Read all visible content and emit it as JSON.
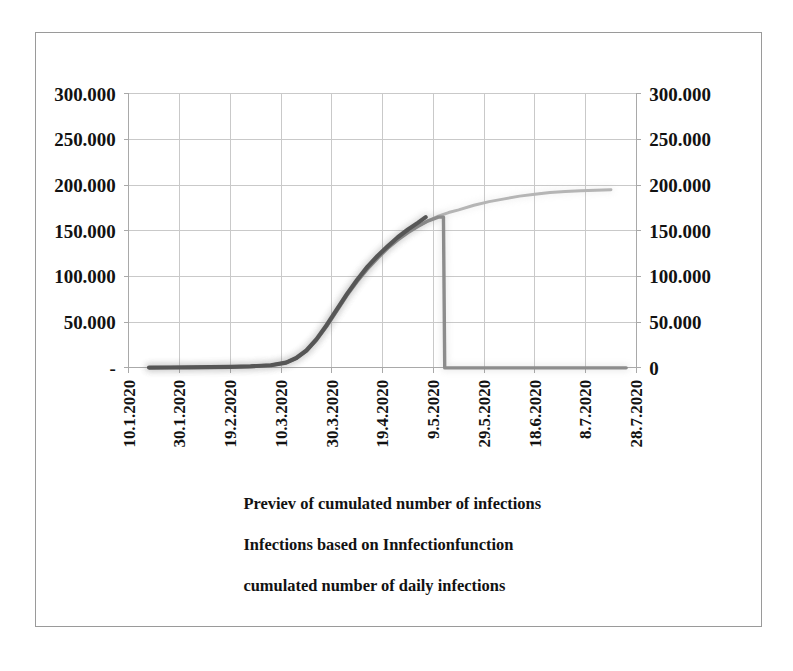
{
  "chart_data": {
    "type": "line",
    "title": "",
    "xlabel": "",
    "ylabel": "",
    "ylim": [
      0,
      300000
    ],
    "y_left_ticks": [
      "-",
      "50.000",
      "100.000",
      "150.000",
      "200.000",
      "250.000",
      "300.000"
    ],
    "y_right_ticks": [
      "0",
      "50.000",
      "100.000",
      "150.000",
      "200.000",
      "250.000",
      "300.000"
    ],
    "y_tick_values": [
      0,
      50000,
      100000,
      150000,
      200000,
      250000,
      300000
    ],
    "grid": true,
    "legend_position": "bottom",
    "x_tick_labels": [
      "10.1.2020",
      "30.1.2020",
      "19.2.2020",
      "10.3.2020",
      "30.3.2020",
      "19.4.2020",
      "9.5.2020",
      "29.5.2020",
      "18.6.2020",
      "8.7.2020",
      "28.7.2020"
    ],
    "x_tick_days": [
      0,
      20,
      40,
      60,
      80,
      100,
      120,
      140,
      160,
      180,
      200
    ],
    "xlim_days": [
      0,
      200
    ],
    "series": [
      {
        "name": "Previev of cumulated number of infections",
        "color": "#b5b5b5",
        "width": 3.0,
        "x": [
          8,
          16,
          24,
          32,
          40,
          48,
          56,
          62,
          66,
          70,
          74,
          78,
          82,
          86,
          90,
          94,
          98,
          102,
          106,
          110,
          114,
          118,
          122,
          126,
          130,
          136,
          142,
          148,
          154,
          160,
          166,
          172,
          178,
          184,
          190
        ],
        "values": [
          400,
          500,
          700,
          900,
          1200,
          1800,
          3000,
          6000,
          11000,
          19000,
          31000,
          46000,
          63000,
          80000,
          95000,
          109000,
          121000,
          132000,
          141000,
          149000,
          155000,
          161000,
          166000,
          170000,
          173000,
          178000,
          182000,
          185000,
          188000,
          190000,
          192000,
          193000,
          194000,
          194500,
          195000
        ]
      },
      {
        "name": "Infections based on Innfectionfunction",
        "color": "#8c8c8c",
        "width": 3.4,
        "x": [
          8,
          16,
          24,
          32,
          40,
          48,
          56,
          62,
          66,
          70,
          74,
          78,
          82,
          86,
          90,
          94,
          98,
          102,
          106,
          110,
          114,
          118,
          122,
          124,
          124.5,
          130,
          140,
          150,
          160,
          170,
          180,
          190,
          196
        ],
        "values": [
          300,
          400,
          600,
          800,
          1100,
          1700,
          2900,
          5800,
          10500,
          18500,
          30500,
          45500,
          62500,
          79500,
          94500,
          108000,
          120000,
          131000,
          140000,
          148000,
          155000,
          161000,
          165000,
          165000,
          0,
          0,
          0,
          0,
          0,
          0,
          0,
          0,
          0
        ]
      },
      {
        "name": "cumulated number of daily infections",
        "color": "#575757",
        "width": 4.2,
        "x": [
          8,
          16,
          24,
          32,
          40,
          48,
          56,
          62,
          66,
          70,
          74,
          78,
          82,
          86,
          90,
          94,
          98,
          102,
          106,
          110,
          114,
          117
        ],
        "values": [
          300,
          400,
          600,
          800,
          1100,
          1700,
          2900,
          5800,
          10800,
          19000,
          31500,
          47000,
          64000,
          81000,
          96500,
          110500,
          122500,
          133000,
          143000,
          151500,
          159000,
          165000
        ]
      }
    ]
  },
  "legend": {
    "entries": [
      {
        "label": "Previev of cumulated number of infections",
        "color": "#b5b5b5",
        "width": 3.0
      },
      {
        "label": "Infections based on Innfectionfunction",
        "color": "#8c8c8c",
        "width": 5.0
      },
      {
        "label": "cumulated number of daily infections",
        "color": "#575757",
        "width": 6.2
      }
    ]
  }
}
